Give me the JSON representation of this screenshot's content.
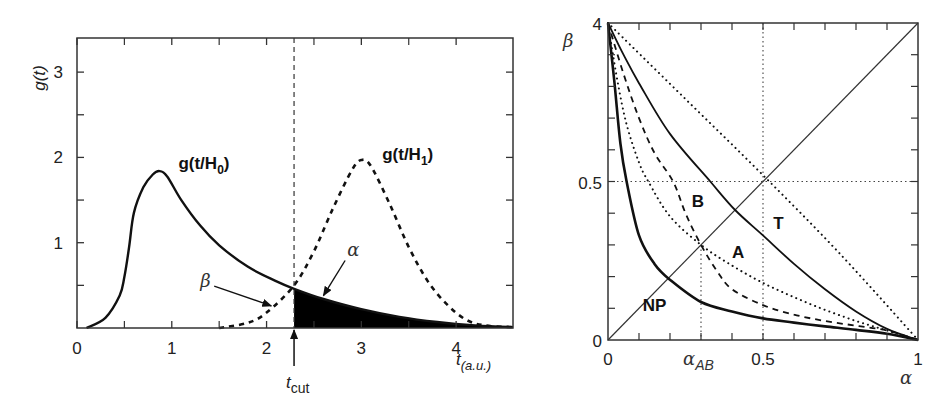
{
  "chart_data": [
    {
      "type": "line",
      "title": "",
      "xlabel": "t(a.u.)",
      "ylabel": "g(t)",
      "xlim": [
        0,
        4.6
      ],
      "ylim": [
        0,
        3.4
      ],
      "x_ticks": [
        0,
        1,
        2,
        3,
        4
      ],
      "y_ticks": [
        1,
        2,
        3
      ],
      "x_minor_ticks": [
        0.5,
        1.5,
        2.5,
        3.5
      ],
      "y_minor_ticks": [
        0.5,
        1.5,
        2.5
      ],
      "grid": false,
      "t_cut": 2.29,
      "t_cut_label": "t",
      "t_cut_sub": "cut",
      "series": [
        {
          "name": "g(t/H0)",
          "label_main": "g(t/H",
          "label_sub": "0",
          "label_end": ")",
          "style": "solid",
          "x": [
            0.1,
            0.3,
            0.45,
            0.5,
            0.55,
            0.6,
            0.7,
            0.8,
            0.87,
            0.95,
            1.1,
            1.3,
            1.5,
            1.8,
            2.1,
            2.29,
            2.6,
            3.0,
            3.4,
            3.8,
            4.2,
            4.6
          ],
          "values": [
            0.0,
            0.12,
            0.38,
            0.6,
            0.95,
            1.35,
            1.65,
            1.8,
            1.84,
            1.78,
            1.5,
            1.2,
            0.97,
            0.72,
            0.55,
            0.46,
            0.34,
            0.22,
            0.13,
            0.07,
            0.03,
            0.01
          ]
        },
        {
          "name": "g(t/H1)",
          "label_main": "g(t/H",
          "label_sub": "1",
          "label_end": ")",
          "style": "dashed",
          "x": [
            1.5,
            1.8,
            2.0,
            2.29,
            2.5,
            2.7,
            2.9,
            3.0,
            3.1,
            3.3,
            3.5,
            3.7,
            3.9,
            4.1,
            4.3,
            4.6
          ],
          "values": [
            0.0,
            0.06,
            0.18,
            0.5,
            0.9,
            1.4,
            1.85,
            1.97,
            1.9,
            1.45,
            0.95,
            0.55,
            0.28,
            0.1,
            0.03,
            0.01
          ]
        }
      ],
      "annotations": [
        {
          "text": "β",
          "arrow_to": [
            2.05,
            0.26
          ],
          "text_at": [
            1.3,
            0.48
          ]
        },
        {
          "text": "α",
          "arrow_to": [
            2.6,
            0.38
          ],
          "text_at": [
            2.85,
            0.85
          ]
        }
      ],
      "shaded_region": {
        "from": 2.29,
        "to": 4.6,
        "under": "g(t/H0)",
        "fill": "#000000"
      }
    },
    {
      "type": "line",
      "title": "",
      "xlabel": "α",
      "ylabel": "β",
      "xlim": [
        0,
        1
      ],
      "ylim": [
        0,
        1
      ],
      "x_tick_labels": [
        {
          "value": 0,
          "text": "0"
        },
        {
          "value": 0.5,
          "text": "0.5"
        },
        {
          "value": 1,
          "text": "1"
        }
      ],
      "y_tick_labels": [
        {
          "value": 0,
          "text": "0"
        },
        {
          "value": 0.5,
          "text": "0.5"
        },
        {
          "value": 1,
          "text": "4"
        }
      ],
      "alpha_AB": 0.3,
      "alpha_AB_label": "α",
      "alpha_AB_sub": "AB",
      "reference_lines": {
        "vertical": [
          0.3,
          0.5
        ],
        "horizontal": [
          0.5
        ],
        "diagonal": true
      },
      "grid": false,
      "series": [
        {
          "name": "NP",
          "style": "solid-thick",
          "x": [
            0,
            0.02,
            0.04,
            0.06,
            0.1,
            0.15,
            0.2,
            0.3,
            0.4,
            0.5,
            0.6,
            0.7,
            0.8,
            0.9,
            1.0
          ],
          "values": [
            1.0,
            0.82,
            0.62,
            0.5,
            0.33,
            0.24,
            0.19,
            0.12,
            0.09,
            0.068,
            0.055,
            0.043,
            0.032,
            0.02,
            0.0
          ]
        },
        {
          "name": "inner-dotted",
          "style": "dotted",
          "x": [
            0,
            0.03,
            0.06,
            0.1,
            0.13,
            0.2,
            0.3,
            0.4,
            0.5,
            0.6,
            0.7,
            0.8,
            0.9,
            1.0
          ],
          "values": [
            1.0,
            0.82,
            0.68,
            0.56,
            0.5,
            0.39,
            0.3,
            0.235,
            0.18,
            0.135,
            0.095,
            0.06,
            0.03,
            0.0
          ]
        },
        {
          "name": "dashed",
          "style": "dashed",
          "x": [
            0,
            0.05,
            0.1,
            0.15,
            0.21,
            0.25,
            0.3,
            0.35,
            0.4,
            0.5,
            0.6,
            0.7,
            0.8,
            0.9,
            1.0
          ],
          "values": [
            1.0,
            0.84,
            0.7,
            0.59,
            0.5,
            0.4,
            0.3,
            0.22,
            0.16,
            0.11,
            0.08,
            0.06,
            0.045,
            0.03,
            0.0
          ]
        },
        {
          "name": "T",
          "style": "solid",
          "x": [
            0,
            0.05,
            0.1,
            0.2,
            0.33,
            0.41,
            0.5,
            0.6,
            0.7,
            0.8,
            0.9,
            1.0
          ],
          "values": [
            1.0,
            0.9,
            0.81,
            0.65,
            0.5,
            0.41,
            0.33,
            0.24,
            0.16,
            0.09,
            0.035,
            0.0
          ]
        },
        {
          "name": "outer-dotted",
          "style": "dotted",
          "x": [
            0,
            0.25,
            0.5,
            0.75,
            1.0
          ],
          "values": [
            1.0,
            0.76,
            0.52,
            0.27,
            0.0
          ]
        }
      ],
      "region_labels": [
        {
          "text": "B",
          "at": [
            0.29,
            0.42
          ]
        },
        {
          "text": "T",
          "at": [
            0.55,
            0.35
          ]
        },
        {
          "text": "A",
          "at": [
            0.42,
            0.26
          ]
        },
        {
          "text": "NP",
          "at": [
            0.15,
            0.09
          ]
        }
      ]
    }
  ],
  "left_plot": {
    "ylabel": "g(t)",
    "xlabel_main": "t",
    "xlabel_sub": "(a.u.)",
    "beta_label": "β",
    "alpha_label": "α"
  },
  "right_plot": {
    "ylabel": "β",
    "xlabel": "α"
  }
}
